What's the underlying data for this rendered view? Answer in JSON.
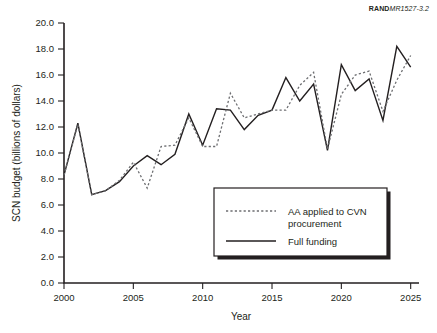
{
  "figure": {
    "id_brand": "RAND",
    "id_number": "MR1527-3.2"
  },
  "chart_data": {
    "type": "line",
    "title": "",
    "xlabel": "Year",
    "ylabel": "SCN budget (billions of dollars)",
    "xlim": [
      2000,
      2025.6
    ],
    "ylim": [
      0.0,
      20.0
    ],
    "grid": false,
    "legend_position": "inside-bottom-right",
    "xticks": [
      2000,
      2005,
      2010,
      2015,
      2020,
      2025
    ],
    "xtick_labels": [
      "2000",
      "2005",
      "2010",
      "2015",
      "2020",
      "2025"
    ],
    "yticks": [
      0.0,
      2.0,
      4.0,
      6.0,
      8.0,
      10.0,
      12.0,
      14.0,
      16.0,
      18.0,
      20.0
    ],
    "ytick_labels": [
      "0.0",
      "2.0",
      "4.0",
      "6.0",
      "8.0",
      "10.0",
      "12.0",
      "14.0",
      "16.0",
      "18.0",
      "20.0"
    ],
    "x": [
      2000,
      2001,
      2002,
      2003,
      2004,
      2005,
      2006,
      2007,
      2008,
      2009,
      2010,
      2011,
      2012,
      2013,
      2014,
      2015,
      2016,
      2017,
      2018,
      2019,
      2020,
      2021,
      2022,
      2023,
      2024,
      2025
    ],
    "series": [
      {
        "name": "Full funding",
        "style": "solid",
        "color": "#231f20",
        "values": [
          8.3,
          12.3,
          6.8,
          7.1,
          7.8,
          9.0,
          9.8,
          9.1,
          9.9,
          13.0,
          10.6,
          13.4,
          13.3,
          11.8,
          12.9,
          13.3,
          15.8,
          14.0,
          15.3,
          10.2,
          16.8,
          14.8,
          15.7,
          12.5,
          18.2,
          16.6
        ]
      },
      {
        "name": "AA applied to CVN procurement",
        "style": "dotted",
        "color": "#6d6e71",
        "values": [
          8.3,
          12.2,
          6.8,
          7.1,
          7.9,
          9.3,
          7.3,
          10.5,
          10.6,
          12.7,
          10.5,
          10.5,
          14.6,
          12.7,
          13.0,
          13.3,
          13.3,
          15.2,
          16.2,
          10.3,
          14.5,
          16.0,
          16.3,
          13.2,
          15.6,
          17.5
        ]
      }
    ]
  },
  "legend": {
    "items": [
      {
        "label_line1": "AA applied to CVN",
        "label_line2": "procurement",
        "style": "dotted"
      },
      {
        "label_line1": "Full funding",
        "label_line2": "",
        "style": "solid"
      }
    ]
  }
}
